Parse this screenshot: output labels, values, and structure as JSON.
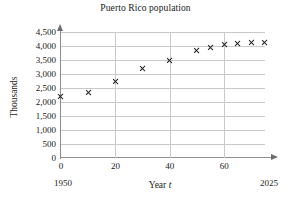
{
  "chart_data": {
    "type": "scatter",
    "title": "Puerto Rico population",
    "xlabel": "Year t",
    "xlabel_prefix": "Year ",
    "xlabel_var": "t",
    "ylabel": "Thousands",
    "x": [
      0,
      10,
      20,
      30,
      40,
      50,
      55,
      60,
      65,
      70,
      75
    ],
    "values": [
      2200,
      2350,
      2750,
      3200,
      3500,
      3850,
      3950,
      4050,
      4100,
      4120,
      4120
    ],
    "xlim": [
      0,
      75
    ],
    "ylim": [
      0,
      4500
    ],
    "xticks": [
      0,
      20,
      40,
      60
    ],
    "xtick_labels": [
      "0",
      "20",
      "40",
      "60"
    ],
    "yticks": [
      0,
      500,
      1000,
      1500,
      2000,
      2500,
      3000,
      3500,
      4000,
      4500
    ],
    "ytick_labels": [
      "0",
      "500",
      "1,000",
      "1,500",
      "2,000",
      "2,500",
      "3,000",
      "3,500",
      "4,000",
      "4,500"
    ],
    "grid": true,
    "grid_color": "#c9c9c9",
    "axis_color": "#8d8d8d",
    "marker_color": "#222222",
    "marker_symbol": "x",
    "legend": null,
    "axis_start_year": "1950",
    "axis_end_year": "2025",
    "background": "#ffffff"
  }
}
